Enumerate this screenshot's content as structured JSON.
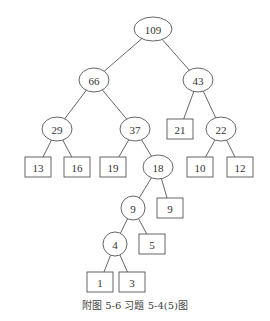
{
  "caption": "附图 5-6   习题 5-4(5)图",
  "tree": {
    "type": "huffman-tree",
    "internal_nodes": [
      {
        "id": "n109",
        "value": "109",
        "x": 153,
        "y": 29,
        "rx": 19,
        "ry": 12
      },
      {
        "id": "n66",
        "value": "66",
        "x": 94,
        "y": 80,
        "rx": 15,
        "ry": 12
      },
      {
        "id": "n43",
        "value": "43",
        "x": 198,
        "y": 80,
        "rx": 15,
        "ry": 12
      },
      {
        "id": "n29",
        "value": "29",
        "x": 57,
        "y": 129,
        "rx": 15,
        "ry": 12
      },
      {
        "id": "n37",
        "value": "37",
        "x": 135,
        "y": 129,
        "rx": 15,
        "ry": 12
      },
      {
        "id": "n22",
        "value": "22",
        "x": 221,
        "y": 129,
        "rx": 15,
        "ry": 12
      },
      {
        "id": "n18",
        "value": "18",
        "x": 158,
        "y": 167,
        "rx": 15,
        "ry": 12
      },
      {
        "id": "n9i",
        "value": "9",
        "x": 133,
        "y": 208,
        "rx": 12,
        "ry": 12
      },
      {
        "id": "n4",
        "value": "4",
        "x": 115,
        "y": 244,
        "rx": 12,
        "ry": 12
      }
    ],
    "leaf_nodes": [
      {
        "id": "l21",
        "value": "21",
        "x": 180,
        "y": 129
      },
      {
        "id": "l13",
        "value": "13",
        "x": 38,
        "y": 167
      },
      {
        "id": "l16",
        "value": "16",
        "x": 77,
        "y": 167
      },
      {
        "id": "l19",
        "value": "19",
        "x": 113,
        "y": 167
      },
      {
        "id": "l10",
        "value": "10",
        "x": 200,
        "y": 167
      },
      {
        "id": "l12",
        "value": "12",
        "x": 240,
        "y": 167
      },
      {
        "id": "l9",
        "value": "9",
        "x": 170,
        "y": 208
      },
      {
        "id": "l5",
        "value": "5",
        "x": 152,
        "y": 244
      },
      {
        "id": "l1",
        "value": "1",
        "x": 100,
        "y": 282
      },
      {
        "id": "l3",
        "value": "3",
        "x": 132,
        "y": 282
      }
    ],
    "edges": [
      [
        "n109",
        "n66"
      ],
      [
        "n109",
        "n43"
      ],
      [
        "n66",
        "n29"
      ],
      [
        "n66",
        "n37"
      ],
      [
        "n43",
        "l21"
      ],
      [
        "n43",
        "n22"
      ],
      [
        "n29",
        "l13"
      ],
      [
        "n29",
        "l16"
      ],
      [
        "n37",
        "l19"
      ],
      [
        "n37",
        "n18"
      ],
      [
        "n22",
        "l10"
      ],
      [
        "n22",
        "l12"
      ],
      [
        "n18",
        "n9i"
      ],
      [
        "n18",
        "l9"
      ],
      [
        "n9i",
        "n4"
      ],
      [
        "n9i",
        "l5"
      ],
      [
        "n4",
        "l1"
      ],
      [
        "n4",
        "l3"
      ]
    ]
  }
}
